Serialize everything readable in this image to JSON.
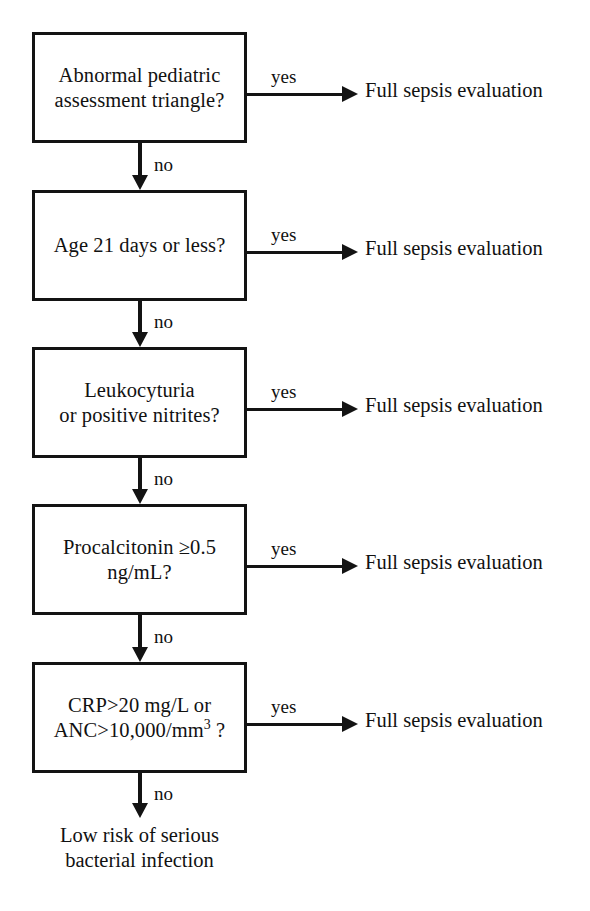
{
  "diagram": {
    "line_color": "#131313",
    "background": "#ffffff",
    "yes_label": "yes",
    "no_label": "no",
    "yes_outcome": "Full sepsis evaluation",
    "terminal": "Low risk of serious\nbacterial infection",
    "nodes": [
      {
        "id": "pat",
        "text": "Abnormal pediatric\nassessment triangle?",
        "yes": "Full sepsis evaluation",
        "no": "no"
      },
      {
        "id": "age",
        "text": "Age 21 days or less?",
        "yes": "Full sepsis evaluation",
        "no": "no"
      },
      {
        "id": "urine",
        "text": "Leukocyturia\nor positive nitrites?",
        "yes": "Full sepsis evaluation",
        "no": "no"
      },
      {
        "id": "pct",
        "text": "Procalcitonin ≥0.5\nng/mL?",
        "yes": "Full sepsis evaluation",
        "no": "no"
      },
      {
        "id": "crp",
        "text_line1": "CRP>20 mg/L or",
        "text_line2_pre": "ANC>10,000/mm",
        "text_line2_sup": "3",
        "text_line2_post": " ?",
        "yes": "Full sepsis evaluation",
        "no": "no"
      }
    ]
  }
}
